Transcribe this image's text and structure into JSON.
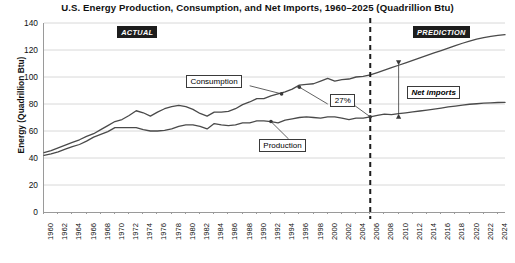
{
  "chart_data": {
    "type": "line",
    "title": "U.S. Energy Production, Consumption, and Net Imports, 1960–2025 (Quadrillion Btu)",
    "xlabel": "",
    "ylabel": "Energy (Quadrillion Btu)",
    "ylim": [
      0,
      140
    ],
    "ytick_step": 20,
    "yticks": [
      0,
      20,
      40,
      60,
      80,
      100,
      120,
      140
    ],
    "xlim": [
      1960,
      2025
    ],
    "xticks": [
      1960,
      1962,
      1964,
      1966,
      1968,
      1970,
      1972,
      1974,
      1976,
      1978,
      1980,
      1982,
      1984,
      1986,
      1988,
      1990,
      1992,
      1994,
      1996,
      1998,
      2000,
      2002,
      2004,
      2006,
      2008,
      2010,
      2012,
      2014,
      2016,
      2018,
      2020,
      2022,
      2024
    ],
    "grid": true,
    "legend": "none",
    "x": [
      1960,
      1961,
      1962,
      1963,
      1964,
      1965,
      1966,
      1967,
      1968,
      1969,
      1970,
      1971,
      1972,
      1973,
      1974,
      1975,
      1976,
      1977,
      1978,
      1979,
      1980,
      1981,
      1982,
      1983,
      1984,
      1985,
      1986,
      1987,
      1988,
      1989,
      1990,
      1991,
      1992,
      1993,
      1994,
      1995,
      1996,
      1997,
      1998,
      1999,
      2000,
      2001,
      2002,
      2003,
      2004,
      2005,
      2006,
      2007,
      2008,
      2009,
      2010,
      2011,
      2012,
      2013,
      2014,
      2015,
      2016,
      2017,
      2018,
      2019,
      2020,
      2021,
      2022,
      2023,
      2024,
      2025
    ],
    "series": [
      {
        "name": "Consumption",
        "values": [
          44.0,
          45.5,
          47.5,
          49.5,
          51.5,
          53.5,
          56.0,
          58.0,
          61.0,
          64.0,
          67.0,
          68.5,
          71.5,
          75.0,
          73.5,
          71.0,
          74.0,
          76.5,
          78.0,
          79.0,
          78.0,
          76.0,
          73.0,
          71.0,
          74.0,
          74.0,
          74.5,
          76.5,
          79.5,
          81.5,
          84.0,
          84.0,
          86.0,
          87.5,
          89.0,
          91.0,
          94.0,
          94.5,
          95.0,
          97.0,
          99.0,
          97.0,
          98.0,
          98.5,
          100.0,
          100.5,
          101.5,
          103.3,
          105.1,
          106.9,
          108.7,
          110.5,
          112.3,
          114.1,
          116.0,
          117.8,
          119.6,
          121.4,
          123.2,
          125.0,
          126.5,
          128.0,
          129.2,
          130.1,
          130.8,
          131.4
        ]
      },
      {
        "name": "Production",
        "values": [
          42.0,
          43.0,
          44.5,
          46.5,
          48.5,
          50.0,
          52.5,
          55.5,
          57.5,
          59.5,
          62.5,
          62.5,
          62.5,
          62.5,
          61.0,
          60.0,
          60.0,
          60.5,
          61.5,
          63.5,
          64.5,
          64.5,
          63.5,
          61.5,
          65.5,
          64.5,
          64.0,
          64.5,
          66.0,
          66.0,
          67.5,
          67.5,
          67.0,
          66.0,
          68.0,
          69.0,
          70.0,
          70.5,
          70.0,
          69.5,
          70.5,
          70.5,
          69.5,
          68.5,
          69.5,
          69.5,
          70.5,
          71.5,
          72.5,
          72.2,
          72.8,
          73.5,
          74.2,
          74.8,
          75.5,
          76.2,
          77.0,
          77.8,
          78.5,
          79.2,
          79.8,
          80.2,
          80.6,
          80.9,
          81.1,
          81.2
        ]
      }
    ],
    "annotations": {
      "actual_badge": "ACTUAL",
      "prediction_badge": "PREDICTION",
      "consumption_label": "Consumption",
      "production_label": "Production",
      "gap_label": "27%",
      "net_imports_label": "Net imports",
      "divider_year": 2006
    },
    "colors": {
      "line": "#4a4a4a",
      "grid": "#d8d8d8",
      "axis": "#9a9a9a",
      "badge_background": "#1d1d1d",
      "badge_text": "#ffffff",
      "background": "#ffffff"
    }
  }
}
